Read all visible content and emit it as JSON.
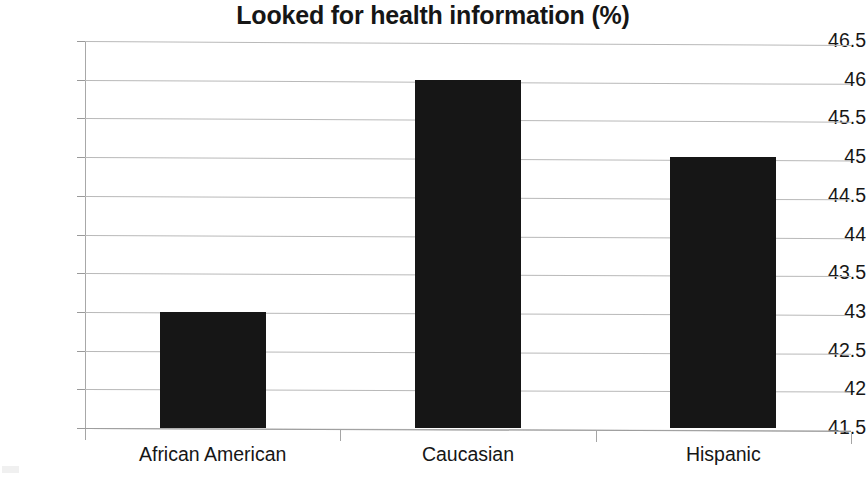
{
  "chart_data": {
    "type": "bar",
    "title": "Looked for health information (%)",
    "xlabel": "",
    "ylabel": "",
    "categories": [
      "African American",
      "Caucasian",
      "Hispanic"
    ],
    "values": [
      43.0,
      46.0,
      45.0
    ],
    "series": [
      {
        "name": "Looked for health information (%)",
        "values": [
          43.0,
          46.0,
          45.0
        ]
      }
    ],
    "ylim": [
      41.5,
      46.5
    ],
    "ytick_labels": [
      "46.5",
      "46",
      "45.5",
      "45",
      "44.5",
      "44",
      "43.5",
      "43",
      "42.5",
      "42",
      "41.5"
    ],
    "ytick_values": [
      46.5,
      46,
      45.5,
      45,
      44.5,
      44,
      43.5,
      43,
      42.5,
      42,
      41.5
    ],
    "grid": true,
    "legend": false,
    "legend_position": "none",
    "bar_color": "#161616",
    "gridline_color": "#b9b9b9",
    "axis_color": "#9d9d9d",
    "background_color": "#ffffff"
  }
}
